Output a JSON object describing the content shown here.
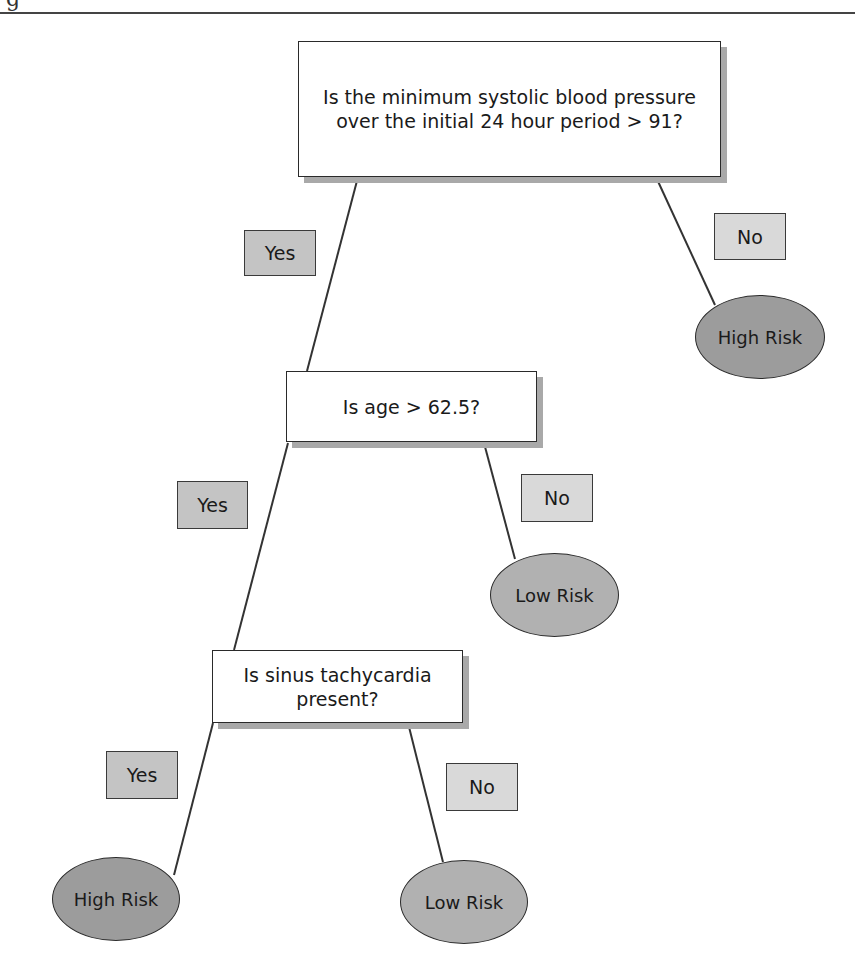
{
  "header": {
    "fragment": "g"
  },
  "tree": {
    "root": {
      "question": "Is the minimum systolic blood pressure over the initial 24 hour period > 91?",
      "yes_label": "Yes",
      "no_label": "No",
      "no_outcome": "High Risk"
    },
    "node2": {
      "question": "Is age > 62.5?",
      "yes_label": "Yes",
      "no_label": "No",
      "no_outcome": "Low Risk"
    },
    "node3": {
      "question": "Is sinus tachycardia present?",
      "yes_label": "Yes",
      "no_label": "No",
      "yes_outcome": "High Risk",
      "no_outcome": "Low Risk"
    }
  },
  "colors": {
    "yes_label_fill": "#c4c4c4",
    "no_label_fill": "#d9d9d9",
    "high_risk_fill": "#9c9c9c",
    "low_risk_fill": "#b1b1b1",
    "box_shadow": "#a9a9a9"
  }
}
